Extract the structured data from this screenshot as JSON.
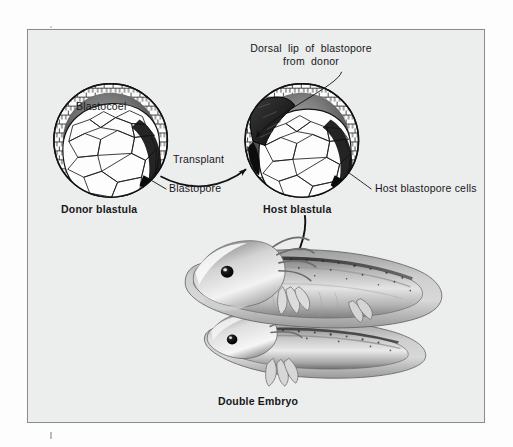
{
  "figure": {
    "kind": "biology-diagram",
    "frame_color": "#8a8d8d",
    "background_color": "#eceded",
    "ink_color": "#17181a"
  },
  "labels": {
    "dorsal_lip_line1": "Dorsal  lip  of  blastopore",
    "dorsal_lip_line2": "from  donor",
    "blastocoel": "Blastocoel",
    "transplant": "Transplant",
    "blastopore": "Blastopore",
    "host_blastopore_cells": "Host blastopore cells",
    "donor_blastula": "Donor blastula",
    "host_blastula": "Host blastula",
    "double_embryo": "Double Embryo"
  },
  "diagram_elements": {
    "donor_blastula": {
      "name": "donor-blastula",
      "center_x": 110,
      "center_y": 140,
      "radius": 57
    },
    "host_blastula": {
      "name": "host-blastula",
      "center_x": 302,
      "center_y": 140,
      "radius": 57
    },
    "transplant_arrow": {
      "name": "transplant-arrow",
      "from_x": 165,
      "from_y": 152,
      "to_x": 252,
      "to_y": 144
    },
    "result_arrow": {
      "name": "result-arrow",
      "from_x": 300,
      "from_y": 215,
      "to_x": 272,
      "to_y": 292
    },
    "double_embryo": {
      "name": "double-embryo-illustration",
      "primary_embryo": "upper larva with external gills and tail fin",
      "secondary_embryo": "lower induced larva with second head"
    }
  }
}
